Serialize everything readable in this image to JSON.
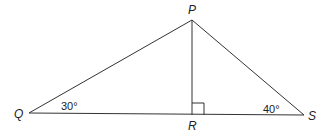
{
  "diagram": {
    "type": "triangle",
    "stroke_color": "#333333",
    "vertices": {
      "P": {
        "label": "P",
        "x": 192,
        "y": 20
      },
      "Q": {
        "label": "Q",
        "x": 29,
        "y": 113
      },
      "R": {
        "label": "R",
        "x": 192,
        "y": 115
      },
      "S": {
        "label": "S",
        "x": 304,
        "y": 115
      }
    },
    "angles": {
      "Q": {
        "label": "30°"
      },
      "S": {
        "label": "40°"
      },
      "R": {
        "label": "right-angle"
      }
    },
    "segments": [
      "PQ",
      "PS",
      "QS",
      "PR"
    ]
  }
}
